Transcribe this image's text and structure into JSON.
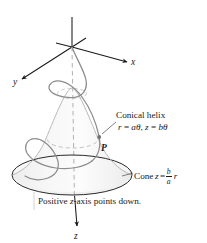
{
  "figure": {
    "axes": {
      "x_label": "x",
      "y_label": "y",
      "z_label": "z"
    },
    "labels": {
      "conical_helix": "Conical helix",
      "helix_equation_r": "r",
      "helix_equation_eq1": " = ",
      "helix_equation_atheta": "aθ",
      "helix_equation_sep": ", ",
      "helix_equation_z": "z",
      "helix_equation_eq2": " = ",
      "helix_equation_btheta": "bθ",
      "point_label": "P",
      "cone_word": "Cone",
      "cone_var_z": "z",
      "cone_equals": "=",
      "cone_frac_num": "b",
      "cone_frac_den": "a",
      "cone_var_r": "r",
      "caption_prefix": "Positive ",
      "caption_var": "z",
      "caption_suffix": "-axis points down."
    },
    "colors": {
      "ink": "#1a1a1a",
      "curve": "#8a8a8a",
      "dashed": "#b0b0b0",
      "cone_fill_light": "#fbfbfb",
      "cone_fill_dark": "#eeeeee",
      "cone_edge": "#9a9a9a",
      "background": "#ffffff"
    },
    "geometry": {
      "origin": [
        72,
        47
      ],
      "cone_apex": [
        72,
        88
      ],
      "base_center": [
        72,
        175
      ],
      "base_rx": 60,
      "base_ry": 20,
      "z_arrow_tip": [
        77,
        228
      ]
    }
  }
}
